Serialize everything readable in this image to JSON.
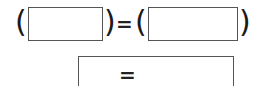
{
  "equation": {
    "open_paren_1": "(",
    "box_1_value": "",
    "close_paren_1": ")",
    "equals": "=",
    "open_paren_2": "(",
    "box_2_value": "",
    "close_paren_2": ")"
  },
  "result_box": {
    "equals": "="
  }
}
